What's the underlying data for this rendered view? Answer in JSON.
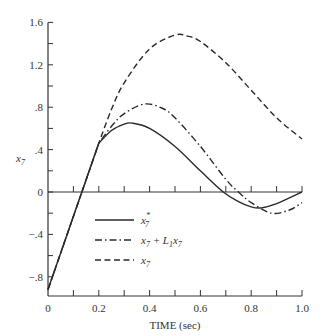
{
  "chart_data": {
    "type": "line",
    "title": "",
    "xlabel": "TIME (sec)",
    "ylabel": "x7",
    "xlim": [
      0,
      1.0
    ],
    "ylim": [
      -0.98,
      1.6
    ],
    "grid": false,
    "legend_position": "inside-lower-middle",
    "x_ticks": [
      0,
      0.2,
      0.4,
      0.6,
      0.8,
      1.0
    ],
    "x_tick_labels": [
      "0",
      "0.2",
      "0.4",
      "0.6",
      "0.8",
      "1.0"
    ],
    "y_ticks": [
      1.6,
      1.2,
      0.8,
      0.4,
      0,
      -0.4,
      -0.8
    ],
    "y_tick_labels": [
      "1.6",
      "1.2",
      ".8",
      ".4",
      "0",
      "−.4",
      "−.8"
    ],
    "series": [
      {
        "name": "x7*",
        "style": "solid",
        "x": [
          0,
          0.1,
          0.2,
          0.25,
          0.3,
          0.33,
          0.4,
          0.5,
          0.6,
          0.69,
          0.75,
          0.8,
          0.84,
          0.9,
          1.0
        ],
        "values": [
          -0.92,
          -0.23,
          0.46,
          0.58,
          0.64,
          0.65,
          0.6,
          0.43,
          0.2,
          0.0,
          -0.09,
          -0.14,
          -0.15,
          -0.11,
          0.0
        ]
      },
      {
        "name": "x7 + L1x7",
        "style": "dashdot",
        "x": [
          0,
          0.1,
          0.2,
          0.25,
          0.3,
          0.38,
          0.45,
          0.5,
          0.6,
          0.7,
          0.75,
          0.8,
          0.88,
          0.95,
          1.0
        ],
        "values": [
          -0.92,
          -0.23,
          0.46,
          0.62,
          0.74,
          0.83,
          0.79,
          0.7,
          0.43,
          0.12,
          0.0,
          -0.1,
          -0.2,
          -0.17,
          -0.1
        ]
      },
      {
        "name": "x7",
        "style": "dashed",
        "x": [
          0,
          0.1,
          0.2,
          0.25,
          0.3,
          0.4,
          0.5,
          0.55,
          0.6,
          0.7,
          0.8,
          0.9,
          1.0
        ],
        "values": [
          -0.92,
          -0.23,
          0.46,
          0.78,
          1.03,
          1.35,
          1.48,
          1.47,
          1.42,
          1.22,
          0.96,
          0.7,
          0.5
        ]
      }
    ]
  },
  "legend": {
    "items": [
      {
        "label": "x",
        "sub": "7",
        "sup": "*",
        "style": "solid"
      },
      {
        "label": "x",
        "sub": "7",
        "rest": " + L",
        "rest_sub": "1",
        "rest2": "x",
        "rest2_sub": "7",
        "style": "dashdot"
      },
      {
        "label": "x",
        "sub": "7",
        "style": "dashed"
      }
    ]
  },
  "top_cut_text": "(… … 6)"
}
